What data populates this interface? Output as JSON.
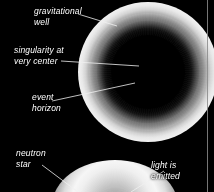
{
  "figure": {
    "background_color": "#000000",
    "label_color": "#ffffff",
    "rule_color": "#8b8b8b",
    "width": 214,
    "height": 192
  },
  "objects": [
    {
      "id": "black-hole",
      "name": "black hole",
      "center": [
        148,
        72
      ],
      "core_radius": 37,
      "glow_outer_radius": 70,
      "appearance": "bright white accretion ring surrounding a black circular core"
    },
    {
      "id": "neutron-star",
      "name": "neutron star",
      "center": [
        115,
        206
      ],
      "radius": 63,
      "appearance": "bright white glowing sphere cropped by the bottom edge"
    }
  ],
  "labels": [
    {
      "id": "gravitational-well",
      "text": "gravitational\nwell",
      "x": 34,
      "y": 6
    },
    {
      "id": "singularity",
      "text": "singularity at\nvery center",
      "x": 14,
      "y": 45
    },
    {
      "id": "event-horizon",
      "text": "event\nhorizon",
      "x": 32,
      "y": 92
    },
    {
      "id": "neutron-star",
      "text": "neutron\nstar",
      "x": 16,
      "y": 148
    },
    {
      "id": "light-emitted",
      "text": "light is\nemitted",
      "x": 151,
      "y": 160
    }
  ],
  "leader_lines": [
    {
      "id": "leader-gravitational-well",
      "x1": 78,
      "y1": 14,
      "x2": 117,
      "y2": 26
    },
    {
      "id": "leader-singularity",
      "x1": 61,
      "y1": 61,
      "x2": 139,
      "y2": 66
    },
    {
      "id": "leader-event-horizon",
      "x1": 52,
      "y1": 101,
      "x2": 135,
      "y2": 83
    },
    {
      "id": "leader-neutron-star",
      "x1": 42,
      "y1": 165,
      "x2": 78,
      "y2": 192
    },
    {
      "id": "leader-light-emitted",
      "x1": 131,
      "y1": 192,
      "x2": 164,
      "y2": 171
    }
  ]
}
